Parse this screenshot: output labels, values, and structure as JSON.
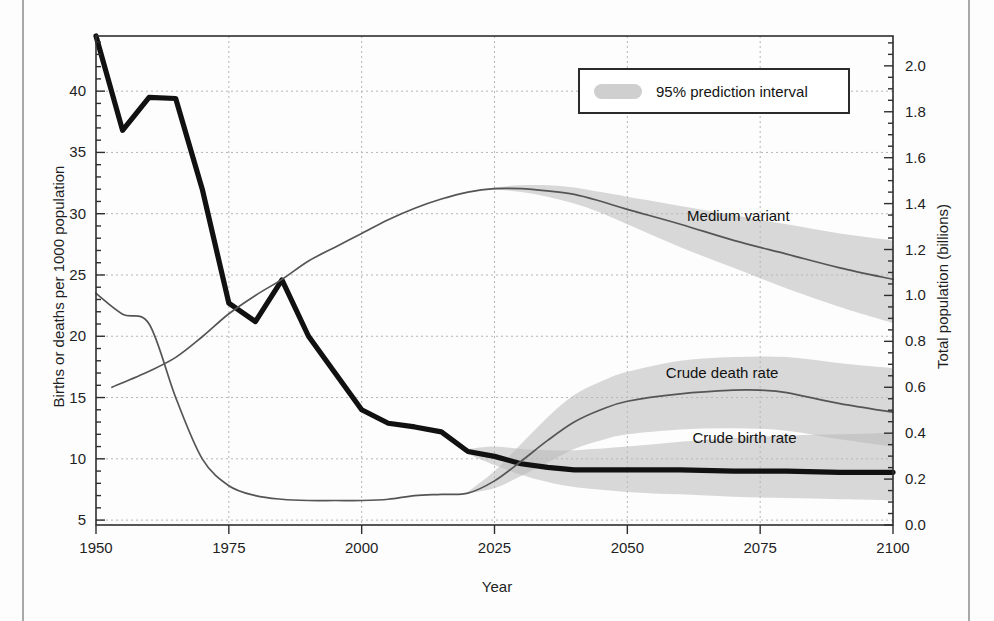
{
  "chart_data": {
    "type": "line",
    "title": "",
    "xlabel": "Year",
    "ylabel": "Births or deaths per 1000 population",
    "y2label": "Total population (billions)",
    "xlim": [
      1950,
      2100
    ],
    "ylim": [
      4.6,
      44.5
    ],
    "y2lim": [
      0.0,
      2.13
    ],
    "grid": true,
    "xticks": [
      1950,
      1975,
      2000,
      2025,
      2050,
      2075,
      2100
    ],
    "xtick_labels": [
      "1950",
      "1975",
      "2000",
      "2025",
      "2050",
      "2075",
      "2100"
    ],
    "yticks": [
      5,
      10,
      15,
      20,
      25,
      30,
      35,
      40
    ],
    "ytick_labels": [
      "5",
      "10",
      "15",
      "20",
      "25",
      "30",
      "35",
      "40"
    ],
    "y2ticks": [
      0.0,
      0.2,
      0.4,
      0.6,
      0.8,
      1.0,
      1.2,
      1.4,
      1.6,
      1.8,
      2.0
    ],
    "y2tick_labels": [
      "0.0",
      "0.2",
      "0.4",
      "0.6",
      "0.8",
      "1.0",
      "1.2",
      "1.4",
      "1.6",
      "1.8",
      "2.0"
    ],
    "legend": {
      "position": "top-right-inside",
      "entries": [
        {
          "label": "95% prediction interval",
          "marker": "shaded-band",
          "color": "#cfcfcf"
        }
      ]
    },
    "annotations": [
      {
        "text": "Medium variant",
        "x": 2062,
        "y_axis": "right",
        "y": 1.34
      },
      {
        "text": "Crude death rate",
        "x": 2058,
        "y_axis": "left",
        "y": 16.9
      },
      {
        "text": "Crude birth rate",
        "x": 2063,
        "y_axis": "left",
        "y": 11.6
      }
    ],
    "series": [
      {
        "name": "Crude birth rate",
        "axis": "left",
        "style": "thick-black",
        "color": "#111111",
        "x": [
          1950,
          1955,
          1960,
          1965,
          1970,
          1975,
          1980,
          1985,
          1990,
          1995,
          2000,
          2005,
          2010,
          2015,
          2020,
          2025,
          2030,
          2035,
          2040,
          2045,
          2050,
          2060,
          2070,
          2080,
          2090,
          2100
        ],
        "values": [
          44.5,
          36.8,
          39.5,
          39.4,
          32.0,
          22.7,
          21.2,
          24.6,
          20.0,
          17.0,
          14.0,
          12.9,
          12.6,
          12.2,
          10.6,
          10.2,
          9.6,
          9.3,
          9.1,
          9.1,
          9.1,
          9.1,
          9.0,
          9.0,
          8.9,
          8.9
        ]
      },
      {
        "name": "Crude birth rate 95% prediction interval",
        "axis": "left",
        "style": "band",
        "color": "#b9b9b9",
        "x": [
          2020,
          2025,
          2030,
          2035,
          2040,
          2050,
          2060,
          2070,
          2080,
          2090,
          2100
        ],
        "lower": [
          10.4,
          9.5,
          8.7,
          8.1,
          7.7,
          7.3,
          7.1,
          6.9,
          6.8,
          6.7,
          6.6
        ],
        "upper": [
          10.8,
          11.0,
          10.8,
          10.7,
          10.7,
          11.0,
          11.4,
          11.7,
          11.9,
          12.0,
          12.1
        ]
      },
      {
        "name": "Crude death rate",
        "axis": "left",
        "style": "thin-dark",
        "color": "#555555",
        "x": [
          1950,
          1955,
          1960,
          1965,
          1970,
          1975,
          1980,
          1985,
          1990,
          1995,
          2000,
          2005,
          2010,
          2015,
          2020,
          2025,
          2030,
          2035,
          2040,
          2045,
          2050,
          2060,
          2070,
          2075,
          2080,
          2090,
          2100
        ],
        "values": [
          23.5,
          21.8,
          21.0,
          15.0,
          10.0,
          7.8,
          7.0,
          6.7,
          6.6,
          6.6,
          6.6,
          6.7,
          7.0,
          7.1,
          7.2,
          8.2,
          9.8,
          11.5,
          13.0,
          14.0,
          14.7,
          15.3,
          15.6,
          15.6,
          15.4,
          14.5,
          13.8
        ]
      },
      {
        "name": "Crude death rate 95% prediction interval",
        "axis": "left",
        "style": "band",
        "color": "#b9b9b9",
        "x": [
          2020,
          2025,
          2030,
          2035,
          2040,
          2045,
          2050,
          2060,
          2070,
          2080,
          2090,
          2100
        ],
        "lower": [
          7.2,
          7.6,
          8.6,
          9.7,
          10.8,
          11.5,
          12.0,
          12.4,
          12.5,
          12.3,
          11.6,
          11.0
        ],
        "upper": [
          7.3,
          9.0,
          11.2,
          13.4,
          15.2,
          16.3,
          17.1,
          18.0,
          18.3,
          18.3,
          17.8,
          17.4
        ]
      },
      {
        "name": "Medium variant (total population)",
        "axis": "right",
        "style": "thin-dark",
        "color": "#555555",
        "x": [
          1953,
          1960,
          1965,
          1970,
          1975,
          1980,
          1985,
          1990,
          1995,
          2000,
          2005,
          2010,
          2015,
          2020,
          2025,
          2030,
          2035,
          2040,
          2045,
          2050,
          2060,
          2070,
          2080,
          2090,
          2100
        ],
        "values": [
          0.6,
          0.67,
          0.73,
          0.82,
          0.92,
          1.0,
          1.07,
          1.15,
          1.21,
          1.27,
          1.33,
          1.38,
          1.42,
          1.45,
          1.465,
          1.465,
          1.455,
          1.44,
          1.41,
          1.375,
          1.31,
          1.24,
          1.18,
          1.12,
          1.07
        ]
      },
      {
        "name": "Medium variant 95% prediction interval",
        "axis": "right",
        "style": "band",
        "color": "#b9b9b9",
        "x": [
          2020,
          2025,
          2030,
          2035,
          2040,
          2045,
          2050,
          2060,
          2070,
          2080,
          2090,
          2100
        ],
        "lower": [
          1.45,
          1.46,
          1.45,
          1.43,
          1.4,
          1.36,
          1.31,
          1.21,
          1.12,
          1.03,
          0.95,
          0.88
        ],
        "upper": [
          1.45,
          1.47,
          1.48,
          1.48,
          1.47,
          1.45,
          1.43,
          1.39,
          1.35,
          1.31,
          1.27,
          1.24
        ]
      }
    ]
  },
  "axes": {
    "left_title": "Births or deaths per 1000 population",
    "right_title": "Total population (billions)",
    "bottom_title": "Year"
  },
  "legend": {
    "label": "95% prediction interval",
    "swatch_color": "#cfcfcf"
  },
  "annotations": {
    "medium_variant": "Medium variant",
    "crude_death_rate": "Crude death rate",
    "crude_birth_rate": "Crude birth rate"
  }
}
